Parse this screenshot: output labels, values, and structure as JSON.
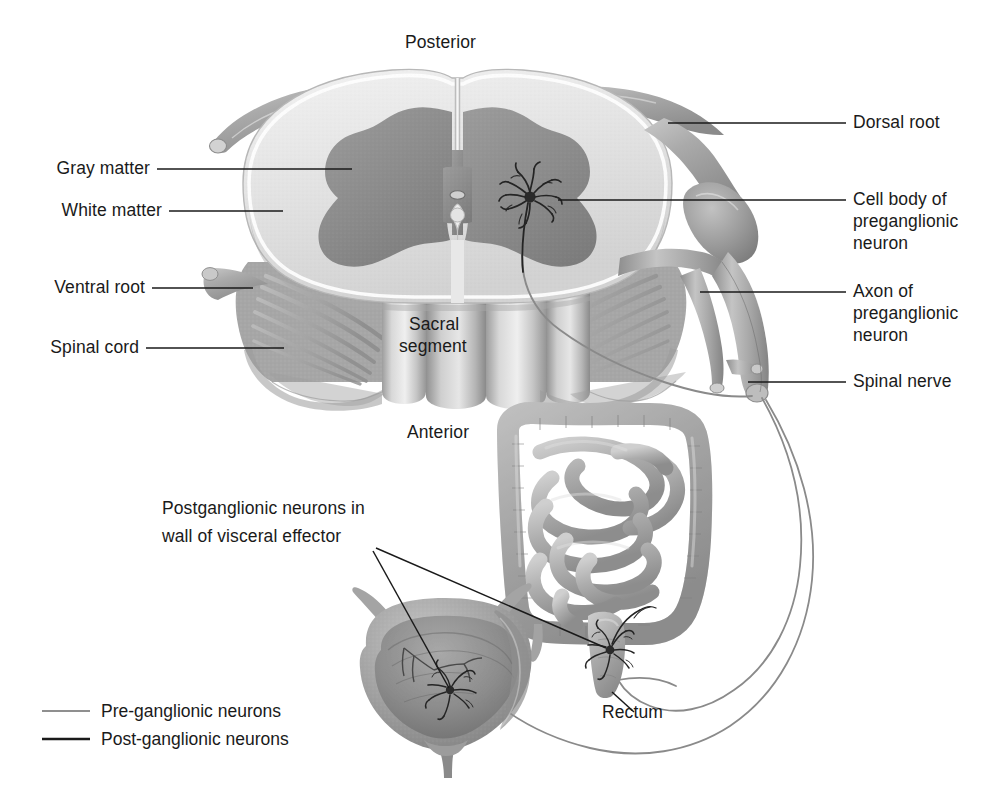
{
  "figure": {
    "background_color": "#ffffff"
  },
  "orientation_labels": {
    "posterior": "Posterior",
    "anterior": "Anterior"
  },
  "cord_overlay": {
    "line1": "Sacral",
    "line2": "segment"
  },
  "labels_left": [
    {
      "id": "gray-matter",
      "text": "Gray matter"
    },
    {
      "id": "white-matter",
      "text": "White matter"
    },
    {
      "id": "ventral-root",
      "text": "Ventral root"
    },
    {
      "id": "spinal-cord",
      "text": "Spinal cord"
    }
  ],
  "labels_right": [
    {
      "id": "dorsal-root",
      "line1": "Dorsal root",
      "line2": "",
      "line3": ""
    },
    {
      "id": "cell-body",
      "line1": "Cell body of",
      "line2": "preganglionic",
      "line3": "neuron"
    },
    {
      "id": "axon",
      "line1": "Axon of",
      "line2": "preganglionic",
      "line3": "neuron"
    },
    {
      "id": "spinal-nerve",
      "line1": "Spinal nerve",
      "line2": "",
      "line3": ""
    }
  ],
  "labels_organs": {
    "postganglionic": {
      "line1": "Postganglionic neurons in",
      "line2": "wall of visceral effector"
    },
    "rectum": "Rectum"
  },
  "legend": {
    "items": [
      {
        "id": "pre-ganglionic",
        "label": "Pre-ganglionic neurons",
        "color": "#8f8f8f",
        "width": 1.6
      },
      {
        "id": "post-ganglionic",
        "label": "Post-ganglionic neurons",
        "color": "#1a1a1a",
        "width": 2.2
      }
    ]
  },
  "colors": {
    "gray_matter": "#8f8f8f",
    "gray_matter_dark": "#7e7e7e",
    "white_matter": "#e2e2e2",
    "white_matter_edge": "#f4f4f4",
    "cord_body": "#b9b9b9",
    "cord_body_dark": "#9a9a9a",
    "nerve": "#a8a8a8",
    "nerve_dark": "#8d8d8d",
    "organ": "#b0b0b0",
    "organ_dark": "#8a8a8a",
    "bladder_interior": "#9a9a9a",
    "leader_line": "#1a1a1a",
    "preganglionic_fiber": "#8a8a8a",
    "neuron_body": "#2a2a2a"
  }
}
